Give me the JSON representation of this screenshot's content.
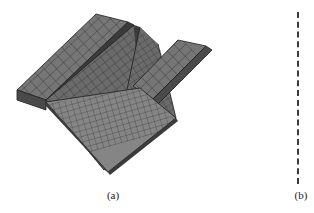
{
  "figure": {
    "background_color": "#ffffff",
    "width": 314,
    "height": 213,
    "panels": [
      {
        "id": "a",
        "caption": "(a)",
        "content_type": "3d-finite-element-mesh",
        "description": "Shaded three-dimensional quadrilateral finite element mesh of a channel-section / U-shaped structural member viewed in oblique projection, with a longitudinal slit along the centre of the web and a rectangular notch cut out of the right flange.",
        "mesh": {
          "element_type": "quadrilateral-shell",
          "fill_color": "#6f6f6f",
          "fill_color_shaded": "#565656",
          "fill_color_dark": "#3e3e3e",
          "fill_color_light": "#8a8a8a",
          "edge_color": "#2a2a2a",
          "edge_width": 0.5
        }
      },
      {
        "id": "b",
        "caption": "(b)",
        "content_type": "cropped-panel",
        "description": "Right-hand panel of the figure, cropped at the image border; only a blank sliver is visible.",
        "mesh": null
      }
    ],
    "divider": {
      "orientation": "vertical",
      "style": "dashed",
      "color": "#3b3b3b",
      "thickness_px": 2,
      "dash_px": 6,
      "gap_px": 3,
      "x_px": 297,
      "y_top_px": 12,
      "y_bottom_px": 184
    }
  }
}
